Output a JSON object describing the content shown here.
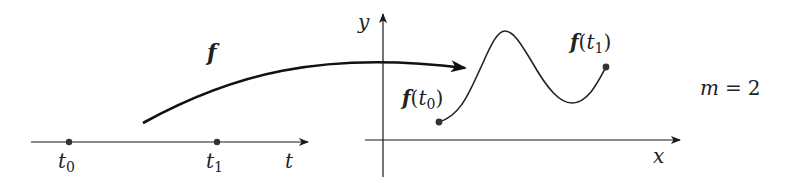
{
  "diagram": {
    "parameter_axis": {
      "label": "t",
      "points": [
        {
          "name": "t0",
          "label": "t",
          "subscript": "0"
        },
        {
          "name": "t1",
          "label": "t",
          "subscript": "1"
        }
      ]
    },
    "mapping": {
      "label": "f"
    },
    "target_plane": {
      "x_label": "x",
      "y_label": "y",
      "start_point": {
        "func": "f",
        "open": "(",
        "var": "t",
        "subscript": "0",
        "close": ")"
      },
      "end_point": {
        "func": "f",
        "open": "(",
        "var": "t",
        "subscript": "1",
        "close": ")"
      }
    },
    "dimension": {
      "var": "m",
      "equals": "=",
      "value": "2"
    },
    "colors": {
      "stroke": "#1a1a1a",
      "point": "#333333",
      "background": "#ffffff"
    }
  }
}
